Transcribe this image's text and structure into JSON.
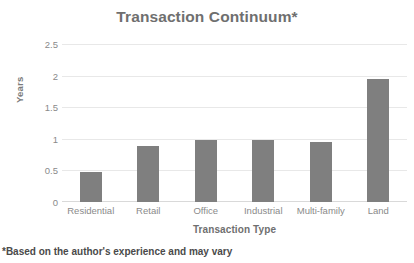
{
  "chart_data": {
    "type": "bar",
    "title": "Transaction Continuum*",
    "xlabel": "Transaction Type",
    "ylabel": "Years",
    "categories": [
      "Residential",
      "Retail",
      "Office",
      "Industrial",
      "Multi-family",
      "Land"
    ],
    "values": [
      0.48,
      0.88,
      0.98,
      0.98,
      0.95,
      1.95
    ],
    "ylim": [
      0,
      2.5
    ],
    "yticks": [
      0,
      0.5,
      1,
      1.5,
      2,
      2.5
    ],
    "ytick_labels": [
      "0",
      "0.5",
      "1",
      "1.5",
      "2",
      "2.5"
    ],
    "grid": "horizontal",
    "legend": "none",
    "bar_color": "#7f7f7f",
    "gridline_color": "#e8e8e8",
    "text_color": "#7c7c7c"
  },
  "footnote": {
    "text": "*Based on the author's experience and may vary"
  }
}
